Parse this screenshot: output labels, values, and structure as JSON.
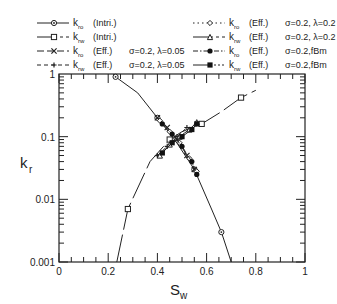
{
  "chart_data": {
    "type": "line",
    "title": "",
    "xlabel": "S",
    "xlabel_sub": "w",
    "ylabel": "k",
    "ylabel_sub": "r",
    "xlim": [
      0,
      1
    ],
    "ylim": [
      0.001,
      1
    ],
    "yscale": "log",
    "grid": false,
    "legend_position": "top",
    "x_ticks": [
      "0",
      "0.2",
      "0.4",
      "0.6",
      "0.8",
      "1"
    ],
    "y_ticks": [
      "0.001",
      "0.01",
      "0.1",
      "1"
    ],
    "legend": [
      {
        "label": "k",
        "sub": "ro",
        "type": "(Intri.)",
        "params": "",
        "line": "solid",
        "marker": "circle-dot"
      },
      {
        "label": "k",
        "sub": "rw",
        "type": "(Intri.)",
        "params": "",
        "line": "solid-dash",
        "marker": "square"
      },
      {
        "label": "k",
        "sub": "ro",
        "type": "(Eff.)",
        "params": "σ=0.2,  λ=0.05",
        "line": "longdash",
        "marker": "x"
      },
      {
        "label": "k",
        "sub": "rw",
        "type": "(Eff.)",
        "params": "σ=0.2,  λ=0.05",
        "line": "dashed",
        "marker": "plus"
      },
      {
        "label": "k",
        "sub": "ro",
        "type": "(Eff.)",
        "params": "σ=0.2,  λ=0.2",
        "line": "dotted",
        "marker": "diamond"
      },
      {
        "label": "k",
        "sub": "rw",
        "type": "(Eff.)",
        "params": "σ=0.2,  λ=0.2",
        "line": "solid-dash",
        "marker": "triangle"
      },
      {
        "label": "k",
        "sub": "ro",
        "type": "(Eff.)",
        "params": "σ=0.2,fBm",
        "line": "dashdot",
        "marker": "filled-circle"
      },
      {
        "label": "k",
        "sub": "rw",
        "type": "(Eff.)",
        "params": "σ=0.2,fBm",
        "line": "solid-dot",
        "marker": "filled-square"
      }
    ],
    "series": [
      {
        "name": "kro (Intri.)",
        "x": [
          0.22,
          0.23,
          0.32,
          0.4,
          0.47,
          0.55,
          0.62,
          0.66,
          0.7
        ],
        "y": [
          1.0,
          0.9,
          0.5,
          0.2,
          0.09,
          0.03,
          0.007,
          0.003,
          0.001
        ]
      },
      {
        "name": "krw (Intri.)",
        "x": [
          0.235,
          0.28,
          0.37,
          0.45,
          0.5,
          0.58,
          0.66,
          0.74,
          0.8
        ],
        "y": [
          0.001,
          0.007,
          0.04,
          0.09,
          0.12,
          0.16,
          0.25,
          0.42,
          0.55
        ]
      },
      {
        "name": "kro (Eff.) λ=0.05",
        "x": [
          0.4,
          0.44,
          0.48,
          0.52,
          0.55
        ],
        "y": [
          0.2,
          0.14,
          0.09,
          0.05,
          0.03
        ]
      },
      {
        "name": "krw (Eff.) λ=0.05",
        "x": [
          0.4,
          0.44,
          0.48,
          0.52
        ],
        "y": [
          0.05,
          0.07,
          0.1,
          0.14
        ]
      },
      {
        "name": "kro (Eff.) λ=0.2",
        "x": [
          0.41,
          0.45,
          0.49,
          0.53,
          0.56
        ],
        "y": [
          0.18,
          0.12,
          0.08,
          0.045,
          0.028
        ]
      },
      {
        "name": "krw (Eff.) λ=0.2",
        "x": [
          0.41,
          0.45,
          0.49,
          0.53,
          0.56
        ],
        "y": [
          0.05,
          0.075,
          0.1,
          0.13,
          0.17
        ]
      },
      {
        "name": "kro (Eff.) fBm",
        "x": [
          0.42,
          0.46,
          0.5,
          0.54,
          0.56
        ],
        "y": [
          0.16,
          0.11,
          0.07,
          0.04,
          0.025
        ]
      },
      {
        "name": "krw (Eff.) fBm",
        "x": [
          0.42,
          0.46,
          0.5,
          0.54,
          0.56
        ],
        "y": [
          0.055,
          0.08,
          0.1,
          0.13,
          0.16
        ]
      }
    ]
  }
}
